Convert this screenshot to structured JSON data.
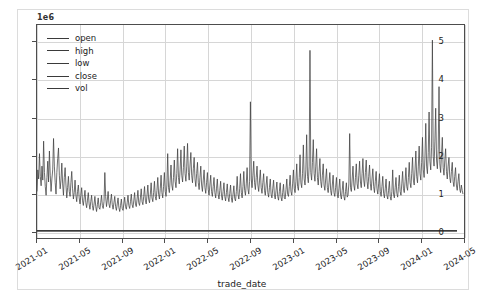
{
  "figure": {
    "clipped_title": "",
    "offset_text": "1e6",
    "xlabel": "trade_date",
    "ylabel": ""
  },
  "legend": {
    "entries": [
      {
        "label": "open",
        "color": "#3a3a3a"
      },
      {
        "label": "high",
        "color": "#3a3a3a"
      },
      {
        "label": "low",
        "color": "#3a3a3a"
      },
      {
        "label": "close",
        "color": "#3a3a3a"
      },
      {
        "label": "vol",
        "color": "#3a3a3a"
      }
    ]
  },
  "axis": {
    "y_ticks": [
      "0",
      "1",
      "2",
      "3",
      "4",
      "5"
    ],
    "y_values": [
      0,
      1,
      2,
      3,
      4,
      5
    ],
    "x_ticks": [
      "2021-01",
      "2021-05",
      "2021-09",
      "2022-01",
      "2022-05",
      "2022-09",
      "2023-01",
      "2023-05",
      "2023-09",
      "2024-01",
      "2024-05"
    ]
  },
  "chart_data": {
    "type": "line",
    "title": "",
    "xlabel": "trade_date",
    "ylabel": "",
    "offset_multiplier": "1e6",
    "grid": true,
    "legend_position": "upper left",
    "ylim": [
      -0.18,
      5.45
    ],
    "xlim": [
      "2021-01",
      "2024-06"
    ],
    "x_tick_labels": [
      "2021-01",
      "2021-05",
      "2021-09",
      "2022-01",
      "2022-05",
      "2022-09",
      "2023-01",
      "2023-05",
      "2023-09",
      "2024-01",
      "2024-05"
    ],
    "y_tick_labels": [
      "0",
      "1",
      "2",
      "3",
      "4",
      "5"
    ],
    "series": [
      {
        "name": "open",
        "visible_as": "flat-line-near-zero",
        "approx_value": 2e-05
      },
      {
        "name": "high",
        "visible_as": "flat-line-near-zero",
        "approx_value": 2e-05
      },
      {
        "name": "low",
        "visible_as": "flat-line-near-zero",
        "approx_value": 2e-05
      },
      {
        "name": "close",
        "visible_as": "flat-line-near-zero",
        "approx_value": 2e-05
      },
      {
        "name": "vol",
        "visible_as": "spiky-trace",
        "units": "shares (millions)",
        "values": [
          1.05,
          1.62,
          1.38,
          2.05,
          1.45,
          1.2,
          1.72,
          1.35,
          2.38,
          1.55,
          1.18,
          0.95,
          1.42,
          1.85,
          1.3,
          2.12,
          1.48,
          1.05,
          1.38,
          1.62,
          2.45,
          1.72,
          1.28,
          0.98,
          1.55,
          1.92,
          2.2,
          1.48,
          1.12,
          1.35,
          1.8,
          1.25,
          0.95,
          1.42,
          1.68,
          1.22,
          0.88,
          1.15,
          1.45,
          1.05,
          0.92,
          1.28,
          1.58,
          1.12,
          0.85,
          1.02,
          1.35,
          0.95,
          0.78,
          1.05,
          1.22,
          0.88,
          0.72,
          0.95,
          1.15,
          0.82,
          0.68,
          0.88,
          1.08,
          0.75,
          0.62,
          0.82,
          1.02,
          0.72,
          0.58,
          0.78,
          0.95,
          0.68,
          0.55,
          0.72,
          0.92,
          0.65,
          0.52,
          0.7,
          0.88,
          0.62,
          0.58,
          0.75,
          0.95,
          0.68,
          0.6,
          0.78,
          1.55,
          0.92,
          0.65,
          0.82,
          1.05,
          0.72,
          0.62,
          0.8,
          0.98,
          0.7,
          0.58,
          0.75,
          0.92,
          0.65,
          0.55,
          0.72,
          0.88,
          0.62,
          0.52,
          0.68,
          0.85,
          0.6,
          0.55,
          0.72,
          0.9,
          0.65,
          0.58,
          0.75,
          0.95,
          0.68,
          0.6,
          0.78,
          0.98,
          0.7,
          0.62,
          0.8,
          1.02,
          0.72,
          0.65,
          0.85,
          1.08,
          0.75,
          0.68,
          0.88,
          1.12,
          0.78,
          0.7,
          0.92,
          1.18,
          0.82,
          0.72,
          0.95,
          1.22,
          0.85,
          0.75,
          0.98,
          1.28,
          0.88,
          0.78,
          1.02,
          1.32,
          0.92,
          0.82,
          1.08,
          1.42,
          0.98,
          0.85,
          1.12,
          1.48,
          1.02,
          0.88,
          1.18,
          1.55,
          1.05,
          0.92,
          1.22,
          2.05,
          1.15,
          1.02,
          1.35,
          1.75,
          1.22,
          1.08,
          1.42,
          1.88,
          1.32,
          1.15,
          1.52,
          2.18,
          1.42,
          1.25,
          1.62,
          2.15,
          1.48,
          1.3,
          1.68,
          2.25,
          1.52,
          1.32,
          1.72,
          2.32,
          1.55,
          1.35,
          1.75,
          2.08,
          1.48,
          1.28,
          1.65,
          1.95,
          1.38,
          1.18,
          1.52,
          1.82,
          1.28,
          1.1,
          1.42,
          1.72,
          1.22,
          1.05,
          1.35,
          1.62,
          1.15,
          1.0,
          1.28,
          1.55,
          1.1,
          0.95,
          1.22,
          1.48,
          1.05,
          0.92,
          1.18,
          1.42,
          1.02,
          0.88,
          1.12,
          1.38,
          0.98,
          0.85,
          1.08,
          1.32,
          0.95,
          0.82,
          1.05,
          1.28,
          0.92,
          0.8,
          1.02,
          1.25,
          0.9,
          0.78,
          1.0,
          1.22,
          0.88,
          0.76,
          0.98,
          1.2,
          0.86,
          0.8,
          1.05,
          1.45,
          0.98,
          0.85,
          1.12,
          1.52,
          1.02,
          0.88,
          1.18,
          1.58,
          1.08,
          0.95,
          1.25,
          1.68,
          1.12,
          0.98,
          1.32,
          3.42,
          1.38,
          1.15,
          1.48,
          1.85,
          1.28,
          1.1,
          1.42,
          1.72,
          1.22,
          1.05,
          1.35,
          1.62,
          1.15,
          1.0,
          1.28,
          1.52,
          1.08,
          0.95,
          1.22,
          1.45,
          1.02,
          0.9,
          1.15,
          1.38,
          0.98,
          0.88,
          1.12,
          1.35,
          0.95,
          0.85,
          1.08,
          1.3,
          0.92,
          0.82,
          1.05,
          1.28,
          0.9,
          0.8,
          1.02,
          1.24,
          0.88,
          0.85,
          1.1,
          1.38,
          0.98,
          0.92,
          1.18,
          1.48,
          1.05,
          0.95,
          1.25,
          1.62,
          1.12,
          1.02,
          1.32,
          1.78,
          1.18,
          1.08,
          1.42,
          2.02,
          1.28,
          1.15,
          1.52,
          2.28,
          1.38,
          1.22,
          1.62,
          2.55,
          1.45,
          1.28,
          1.72,
          4.78,
          1.55,
          1.35,
          1.82,
          2.42,
          1.52,
          1.32,
          1.72,
          2.18,
          1.42,
          1.22,
          1.58,
          1.92,
          1.32,
          1.15,
          1.48,
          1.78,
          1.22,
          1.08,
          1.38,
          1.65,
          1.15,
          1.02,
          1.28,
          1.55,
          1.08,
          0.95,
          1.22,
          1.48,
          1.02,
          0.92,
          1.15,
          1.42,
          0.98,
          0.88,
          1.12,
          1.38,
          0.95,
          0.85,
          1.08,
          1.32,
          0.92,
          0.82,
          1.05,
          1.28,
          0.9,
          0.95,
          1.25,
          2.58,
          1.15,
          1.05,
          1.38,
          1.72,
          1.22,
          1.08,
          1.42,
          1.78,
          1.25,
          1.12,
          1.48,
          1.85,
          1.3,
          1.15,
          1.52,
          1.92,
          1.35,
          1.18,
          1.55,
          1.88,
          1.32,
          1.12,
          1.45,
          1.75,
          1.25,
          1.08,
          1.38,
          1.65,
          1.18,
          1.02,
          1.32,
          1.58,
          1.12,
          0.98,
          1.25,
          1.52,
          1.05,
          0.92,
          1.18,
          1.45,
          1.0,
          0.88,
          1.12,
          1.38,
          0.95,
          0.85,
          1.08,
          1.32,
          0.92,
          0.82,
          1.05,
          1.62,
          0.98,
          0.88,
          1.15,
          1.42,
          1.0,
          0.9,
          1.18,
          1.48,
          1.05,
          0.95,
          1.25,
          1.58,
          1.12,
          1.02,
          1.32,
          1.68,
          1.18,
          1.08,
          1.42,
          1.82,
          1.28,
          1.15,
          1.52,
          1.95,
          1.35,
          1.22,
          1.62,
          2.12,
          1.45,
          1.28,
          1.72,
          2.25,
          1.52,
          1.35,
          1.82,
          2.48,
          1.62,
          1.42,
          1.95,
          2.85,
          1.72,
          1.52,
          2.08,
          3.15,
          1.85,
          1.62,
          2.22,
          5.05,
          1.98,
          1.72,
          2.38,
          3.25,
          1.88,
          1.65,
          2.15,
          3.82,
          1.78,
          1.55,
          2.02,
          2.48,
          1.68,
          1.48,
          1.88,
          2.18,
          1.58,
          1.38,
          1.72,
          1.95,
          1.42,
          1.28,
          1.58,
          1.82,
          1.32,
          1.18,
          1.45,
          1.68,
          1.22,
          1.08,
          1.32,
          1.52,
          1.12,
          1.02,
          1.22,
          1.08,
          0.98
        ]
      }
    ]
  }
}
